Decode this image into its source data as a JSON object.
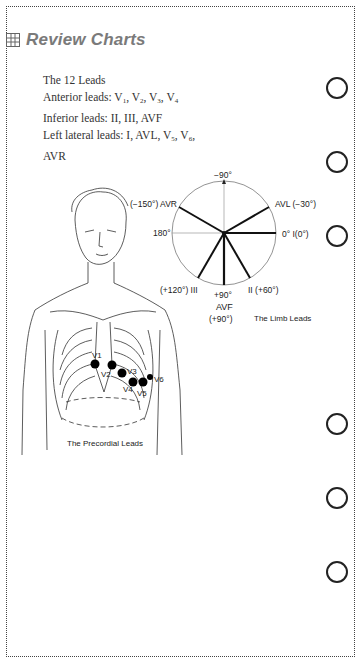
{
  "header": {
    "icon": "grid-icon",
    "title": "Review Charts",
    "title_color": "#7a7a7a"
  },
  "intro": {
    "heading": "The 12 Leads",
    "anterior_label": "Anterior leads: ",
    "anterior_leads": [
      "V1",
      "V2",
      "V3",
      "V4"
    ],
    "inferior": "Inferior leads: II, III, AVF",
    "lateral_label": "Left lateral leads: I, AVL, ",
    "lateral_leads": [
      "V5",
      "V6"
    ],
    "extra": "AVR"
  },
  "limb_diagram": {
    "caption": "The Limb Leads",
    "labels": {
      "top": "−90°",
      "avr": "(−150°) AVR",
      "avl": "AVL (−30°)",
      "left": "180°",
      "right": "0° I(0°)",
      "iii": "(+120°) III",
      "ii": "II (+60°)",
      "bottom": "+90°",
      "avf": "AVF",
      "avf_deg": "(+90°)"
    },
    "leads": [
      {
        "name": "I",
        "angle": 0
      },
      {
        "name": "II",
        "angle": 60
      },
      {
        "name": "AVF",
        "angle": 90
      },
      {
        "name": "III",
        "angle": 120
      },
      {
        "name": "AVR",
        "angle": -150
      },
      {
        "name": "AVL",
        "angle": -30
      }
    ]
  },
  "precordial_diagram": {
    "caption": "The Precordial Leads",
    "electrodes": [
      "V1",
      "V2",
      "V3",
      "V4",
      "V5",
      "V6"
    ]
  },
  "binder_holes": 6
}
